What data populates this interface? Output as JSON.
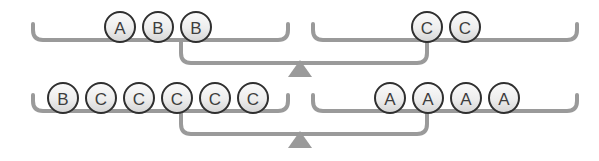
{
  "diagram": {
    "type": "balance-scale-diagram",
    "colors": {
      "bracket_stroke": "#9a9a9a",
      "fulcrum_fill": "#9a9a9a",
      "circle_stroke": "#2f2f2f",
      "circle_fill_top": "#f7f7f7",
      "circle_fill_bottom": "#d8d8d8",
      "label_color": "#3d3d3d",
      "background": "#ffffff"
    },
    "geometry": {
      "circle_radius": 15,
      "circle_spacing": 38,
      "stroke_width": 4
    },
    "scales": [
      {
        "name": "top-scale",
        "fulcrum": {
          "cx": 300,
          "cy": 77,
          "half_width": 12,
          "height": 17
        },
        "beam_y": 63,
        "pans": [
          {
            "name": "top-left-pan",
            "side": "left",
            "bracket": {
              "x1": 33,
              "x2": 288,
              "y": 40,
              "lip_height": 16
            },
            "drop": {
              "x": 181,
              "y_to": 63,
              "x_to": 300
            },
            "tokens": [
              "A",
              "B",
              "B"
            ],
            "tokens_start_x": 120,
            "tokens_y": 27
          },
          {
            "name": "top-right-pan",
            "side": "right",
            "bracket": {
              "x1": 313,
              "x2": 577,
              "y": 40,
              "lip_height": 16
            },
            "drop": {
              "x": 427,
              "y_to": 63,
              "x_to": 300
            },
            "tokens": [
              "C",
              "C"
            ],
            "tokens_start_x": 427,
            "tokens_y": 27
          }
        ]
      },
      {
        "name": "bottom-scale",
        "fulcrum": {
          "cx": 300,
          "cy": 148,
          "half_width": 12,
          "height": 17
        },
        "beam_y": 134,
        "pans": [
          {
            "name": "bottom-left-pan",
            "side": "left",
            "bracket": {
              "x1": 33,
              "x2": 288,
              "y": 111,
              "lip_height": 16
            },
            "drop": {
              "x": 181,
              "y_to": 134,
              "x_to": 300
            },
            "tokens": [
              "B",
              "C",
              "C",
              "C",
              "C",
              "C"
            ],
            "tokens_start_x": 63,
            "tokens_y": 98
          },
          {
            "name": "bottom-right-pan",
            "side": "right",
            "bracket": {
              "x1": 313,
              "x2": 577,
              "y": 111,
              "lip_height": 16
            },
            "drop": {
              "x": 427,
              "y_to": 134,
              "x_to": 300
            },
            "tokens": [
              "A",
              "A",
              "A",
              "A"
            ],
            "tokens_start_x": 390,
            "tokens_y": 98
          }
        ]
      }
    ]
  }
}
